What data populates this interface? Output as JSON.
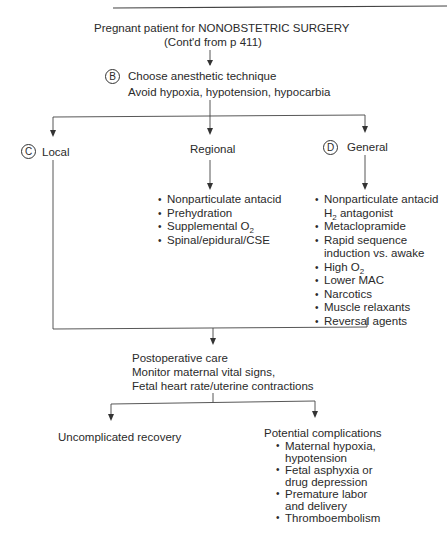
{
  "header": {
    "running_title": "NONOBSTETRIC SURGERY"
  },
  "start": {
    "line1": "Pregnant patient for NONOBSTETRIC SURGERY",
    "line2": "(Cont'd from p 411)"
  },
  "step_b": {
    "marker": "B",
    "line1": "Choose anesthetic technique",
    "line2": "Avoid hypoxia, hypotension, hypocarbia"
  },
  "branches": {
    "local": {
      "marker": "C",
      "label": "Local"
    },
    "regional": {
      "label": "Regional",
      "items": [
        {
          "text": "Nonparticulate antacid"
        },
        {
          "text": "Prehydration"
        },
        {
          "text": "Supplemental O",
          "sub": "2"
        },
        {
          "text": "Spinal/epidural/CSE"
        }
      ]
    },
    "general": {
      "marker": "D",
      "label": "General",
      "items": [
        {
          "text": "Nonparticulate antacid"
        },
        {
          "text": "H",
          "sub": "2",
          "tail": " antagonist",
          "continuation": true
        },
        {
          "text": "Metaclopramide"
        },
        {
          "text": "Rapid sequence"
        },
        {
          "text": "induction vs. awake",
          "continuation": true
        },
        {
          "text": "High O",
          "sub": "2"
        },
        {
          "text": "Lower MAC"
        },
        {
          "text": "Narcotics"
        },
        {
          "text": "Muscle relaxants"
        },
        {
          "text": "Reversal agents"
        }
      ]
    }
  },
  "postop": {
    "line1": "Postoperative care",
    "line2": "Monitor maternal vital signs,",
    "line3": "Fetal heart rate/uterine contractions"
  },
  "outcomes": {
    "uncomplicated": "Uncomplicated recovery",
    "complications": {
      "title": "Potential complications",
      "items": [
        {
          "text": "Maternal hypoxia,"
        },
        {
          "text": "hypotension",
          "continuation": true
        },
        {
          "text": "Fetal asphyxia or"
        },
        {
          "text": "drug depression",
          "continuation": true
        },
        {
          "text": "Premature labor"
        },
        {
          "text": "and delivery",
          "continuation": true
        },
        {
          "text": "Thromboembolism"
        }
      ]
    }
  }
}
